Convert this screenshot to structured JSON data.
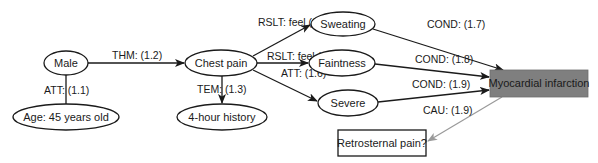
{
  "diagram": {
    "type": "semantic-graph",
    "colors": {
      "line": "#1a1a1a",
      "gray_line": "#9a9a9a",
      "highlight_fill": "#7f7f7f",
      "background": "#ffffff"
    },
    "nodes": {
      "male": {
        "label": "Male",
        "shape": "ellipse"
      },
      "age": {
        "label": "Age: 45 years old",
        "shape": "ellipse"
      },
      "chest_pain": {
        "label": "Chest pain",
        "shape": "ellipse"
      },
      "history": {
        "label": "4-hour history",
        "shape": "ellipse"
      },
      "sweating": {
        "label": "Sweating",
        "shape": "ellipse"
      },
      "faintness": {
        "label": "Faintness",
        "shape": "ellipse"
      },
      "severe": {
        "label": "Severe",
        "shape": "ellipse"
      },
      "mi": {
        "label": "Myocardial infarction",
        "shape": "rect",
        "highlighted": true
      },
      "retrosternal": {
        "label": "Retrosternal pain?",
        "shape": "rect"
      }
    },
    "edges": {
      "e11": {
        "from": "male",
        "to": "age",
        "label": "ATT: (1.1)"
      },
      "e12": {
        "from": "male",
        "to": "chest_pain",
        "label": "THM: (1.2)"
      },
      "e13": {
        "from": "chest_pain",
        "to": "history",
        "label": "TEM: (1.3)"
      },
      "e14": {
        "from": "chest_pain",
        "to": "sweating",
        "label": "RSLT: feel (1.4)"
      },
      "e15": {
        "from": "chest_pain",
        "to": "faintness",
        "label": "RSLT: feel (1.5)"
      },
      "e16": {
        "from": "chest_pain",
        "to": "severe",
        "label": "ATT: (1.6)"
      },
      "e17": {
        "from": "sweating",
        "to": "mi",
        "label": "COND: (1.7)"
      },
      "e18": {
        "from": "faintness",
        "to": "mi",
        "label": "COND: (1.8)"
      },
      "e19a": {
        "from": "severe",
        "to": "mi",
        "label": "COND: (1.9)"
      },
      "e19b": {
        "from": "mi",
        "to": "retrosternal",
        "label": "CAU: (1.9)"
      }
    }
  }
}
